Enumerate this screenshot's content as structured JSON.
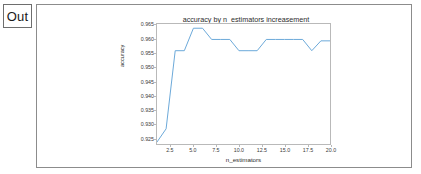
{
  "prompt": {
    "label": "Out"
  },
  "chart_data": {
    "type": "line",
    "title": "accuracy by n_estimators increasement",
    "xlabel": "n_estimators",
    "ylabel": "accuracy",
    "xlim": [
      1,
      20
    ],
    "ylim": [
      0.9228,
      0.9655
    ],
    "grid": false,
    "legend": null,
    "line_color": "#6aa8d8",
    "x": [
      1,
      2,
      3,
      4,
      5,
      6,
      7,
      8,
      9,
      10,
      11,
      12,
      13,
      14,
      15,
      16,
      17,
      18,
      19,
      20
    ],
    "values": [
      0.9235,
      0.9282,
      0.956,
      0.956,
      0.964,
      0.964,
      0.96,
      0.96,
      0.96,
      0.956,
      0.956,
      0.956,
      0.96,
      0.96,
      0.96,
      0.96,
      0.96,
      0.956,
      0.9595,
      0.9595
    ],
    "series": [
      {
        "name": "accuracy",
        "values": [
          0.9235,
          0.9282,
          0.956,
          0.956,
          0.964,
          0.964,
          0.96,
          0.96,
          0.96,
          0.956,
          0.956,
          0.956,
          0.96,
          0.96,
          0.96,
          0.96,
          0.96,
          0.956,
          0.9595,
          0.9595
        ]
      }
    ],
    "yticks": [
      0.925,
      0.93,
      0.935,
      0.94,
      0.945,
      0.95,
      0.955,
      0.96,
      0.965
    ],
    "ytick_labels": [
      "0.925",
      "0.930",
      "0.935",
      "0.940",
      "0.945",
      "0.950",
      "0.955",
      "0.960",
      "0.965"
    ],
    "xticks": [
      2.5,
      5.0,
      7.5,
      10.0,
      12.5,
      15.0,
      17.5,
      20.0
    ],
    "xtick_labels": [
      "2.5",
      "5.0",
      "7.5",
      "10.0",
      "12.5",
      "15.0",
      "17.5",
      "20.0"
    ]
  }
}
